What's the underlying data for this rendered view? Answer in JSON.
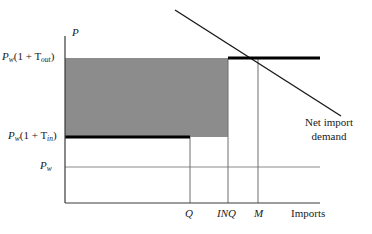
{
  "chart_data": {
    "type": "line",
    "title": "",
    "xlabel": "Imports",
    "ylabel": "P",
    "axis": {
      "origin_x": 65,
      "origin_y": 203,
      "x_end": 320,
      "y_top": 36
    },
    "price_levels": [
      {
        "id": "p_out",
        "label_main": "P",
        "label_sub": "w",
        "label_tail": "(1 + T",
        "label_tail_sub": "out",
        "label_close": ")",
        "y": 58
      },
      {
        "id": "p_in",
        "label_main": "P",
        "label_sub": "w",
        "label_tail": "(1 + T",
        "label_tail_sub": "in",
        "label_close": ")",
        "y": 137
      },
      {
        "id": "p_w",
        "label_main": "P",
        "label_sub": "w",
        "label_tail": "",
        "label_tail_sub": "",
        "label_close": "",
        "y": 167
      }
    ],
    "x_ticks": [
      {
        "id": "q",
        "label": "Q",
        "x": 190
      },
      {
        "id": "inq",
        "label": "INQ",
        "x": 228
      },
      {
        "id": "m",
        "label": "M",
        "x": 258
      }
    ],
    "x_axis_caption": "Imports",
    "y_axis_caption": "P",
    "demand_curve": {
      "name": "Net import demand",
      "label_line1": "Net import",
      "label_line2": "demand",
      "x1": 175,
      "y1": 10,
      "x2": 341,
      "y2": 116
    },
    "shaded_region": {
      "name": "quota-rent-area",
      "x1": 65,
      "x2": 228,
      "y_top": 58,
      "y_bottom": 137,
      "color": "#8c8c8c"
    },
    "supply_steps": [
      {
        "id": "step-in",
        "x1": 65,
        "x2": 190,
        "y": 137
      },
      {
        "id": "step-out",
        "x1": 228,
        "x2": 320,
        "y": 58
      }
    ],
    "colors": {
      "ink": "#1a1a1a",
      "axis": "#3a3a3a",
      "shade": "#8c8c8c",
      "thin": "#8a8a8a"
    }
  }
}
